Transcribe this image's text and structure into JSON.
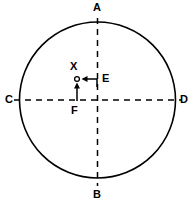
{
  "figure": {
    "background_color": "#ffffff",
    "stroke_color": "#000000",
    "circle": {
      "center_x": 97.5,
      "center_y": 100,
      "radius": 78,
      "stroke_width": 1.6
    },
    "vertical_diameter": {
      "x": 97.5,
      "y_top": 18,
      "y_bottom": 186,
      "dash": "6 5"
    },
    "horizontal_diameter": {
      "y": 100,
      "x_left": 14,
      "x_right": 181,
      "dash": "6 5"
    },
    "marker": {
      "name": "point-x",
      "cx": 77,
      "cy": 79,
      "r": 2.4,
      "filled": false
    },
    "arrow_e": {
      "name": "arrow-e",
      "path": "M 97 86 L 97 79 L 84 79",
      "head": "84,79 89,76.4 89,81.6"
    },
    "arrow_f": {
      "name": "arrow-f",
      "path": "M 77 100 L 77 85",
      "head": "77,82 74.4,87 79.6,87"
    },
    "labels": {
      "a": "A",
      "b": "B",
      "c": "C",
      "d": "D",
      "x": "X",
      "e": "E",
      "f": "F"
    }
  }
}
